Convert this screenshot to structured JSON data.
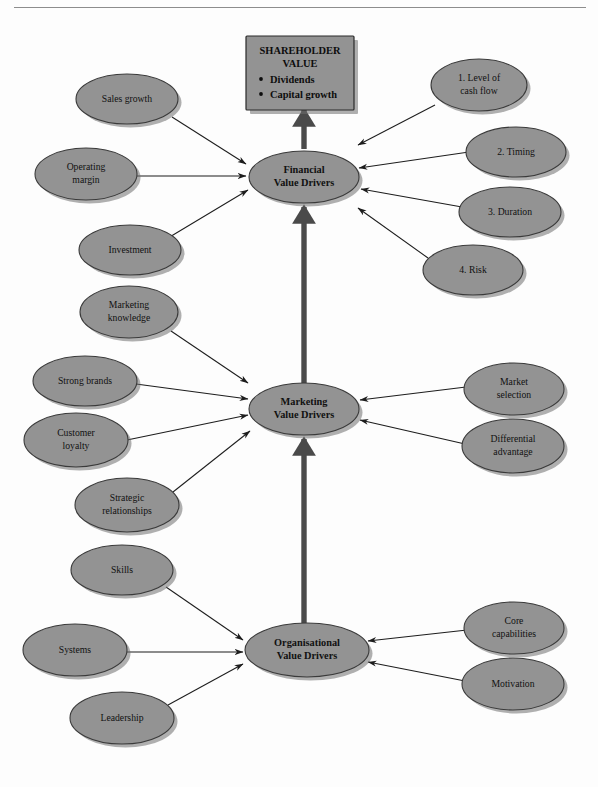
{
  "page": {
    "background_color": "#fdfdfd",
    "rule_color": "#8d8d8d"
  },
  "theme": {
    "node_fill": "#939393",
    "node_stroke": "#3a3a3a",
    "shadow_color": "#6f6f6f",
    "arrow_color": "#1d1d1d",
    "thick_arrow_color": "#4a4a4a",
    "text_color": "#111111"
  },
  "shareholder_box": {
    "title_line1": "SHAREHOLDER",
    "title_line2": "VALUE",
    "bullets": [
      "Dividends",
      "Capital growth"
    ]
  },
  "core_nodes": [
    {
      "id": "financial",
      "line1": "Financial",
      "line2": "Value Drivers",
      "cx": 304,
      "cy": 177,
      "rx": 55,
      "ry": 26
    },
    {
      "id": "marketing",
      "line1": "Marketing",
      "line2": "Value Drivers",
      "cx": 304,
      "cy": 409,
      "rx": 55,
      "ry": 26
    },
    {
      "id": "organisational",
      "line1": "Organisational",
      "line2": "Value Drivers",
      "cx": 307,
      "cy": 650,
      "rx": 62,
      "ry": 27
    }
  ],
  "driver_nodes": [
    {
      "id": "sales-growth",
      "line1": "Sales growth",
      "line2": "",
      "cx": 127,
      "cy": 99,
      "rx": 51,
      "ry": 25,
      "target": "financial"
    },
    {
      "id": "operating-margin",
      "line1": "Operating",
      "line2": "margin",
      "cx": 86,
      "cy": 174,
      "rx": 51,
      "ry": 26,
      "target": "financial"
    },
    {
      "id": "investment",
      "line1": "Investment",
      "line2": "",
      "cx": 130,
      "cy": 250,
      "rx": 51,
      "ry": 25,
      "target": "financial"
    },
    {
      "id": "marketing-knowledge",
      "line1": "Marketing",
      "line2": "knowledge",
      "cx": 129,
      "cy": 312,
      "rx": 49,
      "ry": 26,
      "target": "marketing"
    },
    {
      "id": "strong-brands",
      "line1": "Strong brands",
      "line2": "",
      "cx": 85,
      "cy": 381,
      "rx": 52,
      "ry": 25,
      "target": "marketing"
    },
    {
      "id": "customer-loyalty",
      "line1": "Customer",
      "line2": "loyalty",
      "cx": 76,
      "cy": 440,
      "rx": 52,
      "ry": 27,
      "target": "marketing"
    },
    {
      "id": "strategic-relationships",
      "line1": "Strategic",
      "line2": "relationships",
      "cx": 127,
      "cy": 505,
      "rx": 52,
      "ry": 27,
      "target": "marketing"
    },
    {
      "id": "skills",
      "line1": "Skills",
      "line2": "",
      "cx": 122,
      "cy": 570,
      "rx": 51,
      "ry": 25,
      "target": "organisational"
    },
    {
      "id": "systems",
      "line1": "Systems",
      "line2": "",
      "cx": 75,
      "cy": 650,
      "rx": 52,
      "ry": 26,
      "target": "organisational"
    },
    {
      "id": "leadership",
      "line1": "Leadership",
      "line2": "",
      "cx": 122,
      "cy": 718,
      "rx": 52,
      "ry": 26,
      "target": "organisational"
    },
    {
      "id": "level-of-cash-flow",
      "line1": "1. Level of",
      "line2": "cash flow",
      "cx": 479,
      "cy": 85,
      "rx": 48,
      "ry": 26,
      "target": "financial"
    },
    {
      "id": "timing",
      "line1": "2. Timing",
      "line2": "",
      "cx": 516,
      "cy": 152,
      "rx": 50,
      "ry": 25,
      "target": "financial"
    },
    {
      "id": "duration",
      "line1": "3. Duration",
      "line2": "",
      "cx": 510,
      "cy": 212,
      "rx": 51,
      "ry": 25,
      "target": "financial"
    },
    {
      "id": "risk",
      "line1": "4. Risk",
      "line2": "",
      "cx": 473,
      "cy": 270,
      "rx": 50,
      "ry": 25,
      "target": "financial"
    },
    {
      "id": "market-selection",
      "line1": "Market",
      "line2": "selection",
      "cx": 514,
      "cy": 389,
      "rx": 50,
      "ry": 26,
      "target": "marketing"
    },
    {
      "id": "differential-advantage",
      "line1": "Differential",
      "line2": "advantage",
      "cx": 513,
      "cy": 446,
      "rx": 51,
      "ry": 27,
      "target": "marketing"
    },
    {
      "id": "core-capabilities",
      "line1": "Core",
      "line2": "capabilities",
      "cx": 514,
      "cy": 628,
      "rx": 50,
      "ry": 26,
      "target": "organisational"
    },
    {
      "id": "motivation",
      "line1": "Motivation",
      "line2": "",
      "cx": 513,
      "cy": 684,
      "rx": 51,
      "ry": 26,
      "target": "organisational"
    }
  ],
  "connections": {
    "left_arrows": [
      {
        "from": "sales-growth",
        "x1": 172,
        "y1": 117,
        "x2": 246,
        "y2": 164
      },
      {
        "from": "operating-margin",
        "x1": 137,
        "y1": 176,
        "x2": 246,
        "y2": 176
      },
      {
        "from": "investment",
        "x1": 168,
        "y1": 238,
        "x2": 248,
        "y2": 190
      },
      {
        "from": "marketing-knowledge",
        "x1": 171,
        "y1": 331,
        "x2": 248,
        "y2": 383
      },
      {
        "from": "strong-brands",
        "x1": 136,
        "y1": 384,
        "x2": 248,
        "y2": 399
      },
      {
        "from": "customer-loyalty",
        "x1": 127,
        "y1": 440,
        "x2": 248,
        "y2": 415
      },
      {
        "from": "strategic-relationships",
        "x1": 173,
        "y1": 492,
        "x2": 250,
        "y2": 431
      },
      {
        "from": "skills",
        "x1": 166,
        "y1": 587,
        "x2": 243,
        "y2": 640
      },
      {
        "from": "systems",
        "x1": 126,
        "y1": 652,
        "x2": 243,
        "y2": 652
      },
      {
        "from": "leadership",
        "x1": 168,
        "y1": 705,
        "x2": 243,
        "y2": 664
      }
    ],
    "right_arrows": [
      {
        "from": "level-of-cash-flow",
        "x1": 435,
        "y1": 105,
        "x2": 358,
        "y2": 145
      },
      {
        "from": "timing",
        "x1": 469,
        "y1": 152,
        "x2": 359,
        "y2": 168
      },
      {
        "from": "duration",
        "x1": 462,
        "y1": 207,
        "x2": 361,
        "y2": 189
      },
      {
        "from": "risk",
        "x1": 428,
        "y1": 258,
        "x2": 358,
        "y2": 208
      },
      {
        "from": "market-selection",
        "x1": 466,
        "y1": 387,
        "x2": 360,
        "y2": 400
      },
      {
        "from": "differential-advantage",
        "x1": 465,
        "y1": 444,
        "x2": 360,
        "y2": 420
      },
      {
        "from": "core-capabilities",
        "x1": 467,
        "y1": 630,
        "x2": 368,
        "y2": 641
      },
      {
        "from": "motivation",
        "x1": 465,
        "y1": 681,
        "x2": 368,
        "y2": 662
      }
    ],
    "spine_arrows": [
      {
        "id": "marketing-to-financial",
        "x1": 304,
        "y1": 383,
        "x2": 304,
        "y2": 207
      },
      {
        "id": "organisational-to-marketing",
        "x1": 304,
        "y1": 623,
        "x2": 304,
        "y2": 439
      },
      {
        "id": "financial-to-shareholder",
        "x1": 304,
        "y1": 149,
        "x2": 304,
        "y2": 110
      }
    ]
  }
}
